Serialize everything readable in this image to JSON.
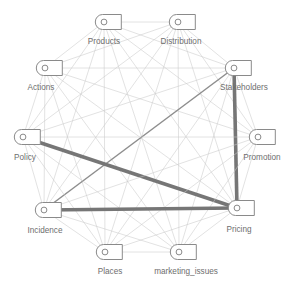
{
  "graph": {
    "title": "marketing concept network",
    "layout": "circular",
    "node_count": 10,
    "edge_style": "straight-line",
    "colors": {
      "background": "#ffffff",
      "node_stroke": "#8a8a8a",
      "node_fill": "#ffffff",
      "node_port_stroke": "#8a8a8a",
      "label_text": "#6e6e6e",
      "edge_thin": "#c9c9c9",
      "edge_medium": "#8e8e8e",
      "edge_thick": "#767676"
    },
    "nodes": [
      {
        "id": "products",
        "label": "Products",
        "cx": 104,
        "cy": 22,
        "label_x": 104,
        "label_y": 44,
        "label_anchor": "middle"
      },
      {
        "id": "distribution",
        "label": "Distribution",
        "cx": 178,
        "cy": 22,
        "label_x": 181,
        "label_y": 44,
        "label_anchor": "middle"
      },
      {
        "id": "actions",
        "label": "Actions",
        "cx": 45,
        "cy": 68,
        "label_x": 41,
        "label_y": 90,
        "label_anchor": "middle"
      },
      {
        "id": "stakeholders",
        "label": "Stakeholders",
        "cx": 234,
        "cy": 68,
        "label_x": 244,
        "label_y": 90,
        "label_anchor": "middle"
      },
      {
        "id": "policy",
        "label": "Policy",
        "cx": 23,
        "cy": 137,
        "label_x": 25,
        "label_y": 160,
        "label_anchor": "middle"
      },
      {
        "id": "promotion",
        "label": "Promotion",
        "cx": 258,
        "cy": 137,
        "label_x": 262,
        "label_y": 160,
        "label_anchor": "middle"
      },
      {
        "id": "incidence",
        "label": "Incidence",
        "cx": 44,
        "cy": 210,
        "label_x": 45,
        "label_y": 233,
        "label_anchor": "middle"
      },
      {
        "id": "pricing",
        "label": "Pricing",
        "cx": 237,
        "cy": 208,
        "label_x": 239,
        "label_y": 232,
        "label_anchor": "middle"
      },
      {
        "id": "places",
        "label": "Places",
        "cx": 105,
        "cy": 252,
        "label_x": 110,
        "label_y": 274,
        "label_anchor": "middle"
      },
      {
        "id": "marketing_issues",
        "label": "marketing_issues",
        "cx": 179,
        "cy": 252,
        "label_x": 186,
        "label_y": 274,
        "label_anchor": "middle"
      }
    ],
    "edges": [
      {
        "source": "products",
        "target": "distribution",
        "weight": 1
      },
      {
        "source": "products",
        "target": "actions",
        "weight": 1
      },
      {
        "source": "products",
        "target": "stakeholders",
        "weight": 1
      },
      {
        "source": "products",
        "target": "policy",
        "weight": 1
      },
      {
        "source": "products",
        "target": "promotion",
        "weight": 1
      },
      {
        "source": "products",
        "target": "incidence",
        "weight": 1
      },
      {
        "source": "products",
        "target": "pricing",
        "weight": 1
      },
      {
        "source": "products",
        "target": "places",
        "weight": 1
      },
      {
        "source": "products",
        "target": "marketing_issues",
        "weight": 1
      },
      {
        "source": "distribution",
        "target": "actions",
        "weight": 1
      },
      {
        "source": "distribution",
        "target": "stakeholders",
        "weight": 1
      },
      {
        "source": "distribution",
        "target": "policy",
        "weight": 1
      },
      {
        "source": "distribution",
        "target": "promotion",
        "weight": 1
      },
      {
        "source": "distribution",
        "target": "incidence",
        "weight": 1
      },
      {
        "source": "distribution",
        "target": "pricing",
        "weight": 1
      },
      {
        "source": "distribution",
        "target": "places",
        "weight": 1
      },
      {
        "source": "distribution",
        "target": "marketing_issues",
        "weight": 1
      },
      {
        "source": "actions",
        "target": "stakeholders",
        "weight": 1
      },
      {
        "source": "actions",
        "target": "policy",
        "weight": 1
      },
      {
        "source": "actions",
        "target": "promotion",
        "weight": 1
      },
      {
        "source": "actions",
        "target": "incidence",
        "weight": 1
      },
      {
        "source": "actions",
        "target": "pricing",
        "weight": 1
      },
      {
        "source": "actions",
        "target": "places",
        "weight": 1
      },
      {
        "source": "actions",
        "target": "marketing_issues",
        "weight": 1
      },
      {
        "source": "stakeholders",
        "target": "policy",
        "weight": 1
      },
      {
        "source": "stakeholders",
        "target": "promotion",
        "weight": 1
      },
      {
        "source": "stakeholders",
        "target": "places",
        "weight": 1
      },
      {
        "source": "stakeholders",
        "target": "marketing_issues",
        "weight": 1
      },
      {
        "source": "stakeholders",
        "target": "incidence",
        "weight": 2
      },
      {
        "source": "stakeholders",
        "target": "pricing",
        "weight": 3
      },
      {
        "source": "policy",
        "target": "promotion",
        "weight": 1
      },
      {
        "source": "policy",
        "target": "incidence",
        "weight": 1
      },
      {
        "source": "policy",
        "target": "places",
        "weight": 1
      },
      {
        "source": "policy",
        "target": "marketing_issues",
        "weight": 1
      },
      {
        "source": "policy",
        "target": "pricing",
        "weight": 3
      },
      {
        "source": "promotion",
        "target": "incidence",
        "weight": 1
      },
      {
        "source": "promotion",
        "target": "pricing",
        "weight": 1
      },
      {
        "source": "promotion",
        "target": "places",
        "weight": 1
      },
      {
        "source": "promotion",
        "target": "marketing_issues",
        "weight": 1
      },
      {
        "source": "incidence",
        "target": "places",
        "weight": 1
      },
      {
        "source": "incidence",
        "target": "marketing_issues",
        "weight": 1
      },
      {
        "source": "incidence",
        "target": "pricing",
        "weight": 3
      },
      {
        "source": "pricing",
        "target": "places",
        "weight": 1
      },
      {
        "source": "pricing",
        "target": "marketing_issues",
        "weight": 1
      },
      {
        "source": "places",
        "target": "marketing_issues",
        "weight": 1
      }
    ],
    "weight_styles": {
      "1": {
        "color": "#c9c9c9",
        "width": 0.55
      },
      "2": {
        "color": "#8e8e8e",
        "width": 1.5
      },
      "3": {
        "color": "#767676",
        "width": 3.6
      }
    }
  }
}
